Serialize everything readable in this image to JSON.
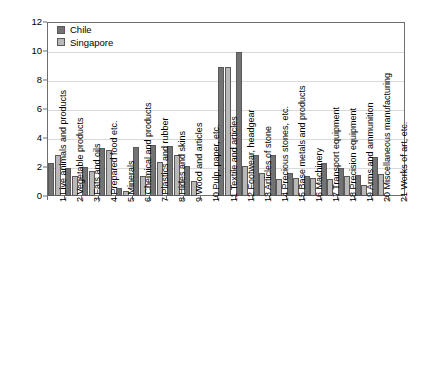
{
  "chart_data": {
    "type": "bar",
    "title": "",
    "subtitle": "",
    "xlabel": "",
    "ylabel": "",
    "ylim": [
      0,
      12
    ],
    "yticks": [
      0,
      2,
      4,
      6,
      8,
      10,
      12
    ],
    "ytick_labels": [
      "0",
      "2",
      "4",
      "6",
      "8",
      "10",
      "12"
    ],
    "grid": true,
    "legend_position": "top-left",
    "categories": [
      "1 Live animals and products",
      "2 Vegetable products",
      "3 Fats and oils",
      "4 Prepared food etc.",
      "5 Minerals",
      "6 Chemical and products",
      "7 Plastics and rubber",
      "8 Hides and skins",
      "9 Wood and articles",
      "10 Pulp, paper, etc.",
      "11 Textile and articles",
      "12 Footwear, headgear",
      "13 Articles of stone",
      "14 Precious stones, etc.",
      "15 Base metals and products",
      "16 Machinery",
      "17 Transport equipment",
      "18 Precision equipment",
      "19 Arms and ammunition",
      "20 Miscellaneous manufacturing",
      "21 Works of art, etc."
    ],
    "series": [
      {
        "name": "Chile",
        "color": "#737373",
        "values": [
          2.25,
          1.95,
          2.0,
          3.3,
          0.55,
          3.35,
          3.5,
          3.45,
          2.1,
          0,
          8.9,
          9.9,
          2.85,
          2.8,
          1.6,
          1.4,
          2.25,
          1.95,
          1.45,
          2.7,
          0
        ]
      },
      {
        "name": "Singapore",
        "color": "#b8b8b8",
        "values": [
          2.85,
          1.4,
          1.7,
          3.15,
          0.35,
          1.35,
          2.35,
          2.85,
          1.05,
          0,
          8.9,
          2.05,
          1.6,
          1.2,
          1.25,
          1.25,
          1.2,
          1.4,
          0.75,
          1.5,
          0
        ]
      }
    ]
  },
  "legend": {
    "entries": [
      {
        "label": "Chile"
      },
      {
        "label": "Singapore"
      }
    ]
  }
}
